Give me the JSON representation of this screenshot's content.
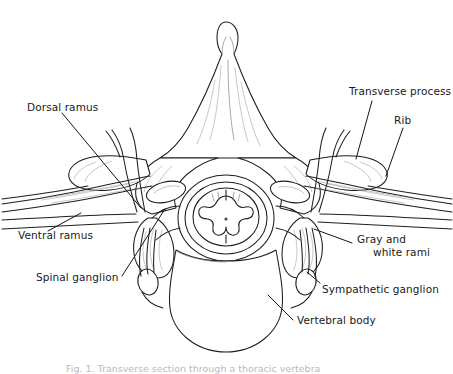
{
  "figure": {
    "background_color": "#ffffff",
    "line_color": "#1d1d1d",
    "label_color": "#1a1a1a",
    "caption_partial": "Fig. 1. Transverse section through a thoracic vertebra"
  },
  "labels": {
    "dorsal_ramus": "Dorsal ramus",
    "ventral_ramus": "Ventral ramus",
    "spinal_ganglion": "Spinal ganglion",
    "transverse_process": "Transverse process",
    "rib": "Rib",
    "gray_rami_line1": "Gray and",
    "gray_rami_line2": "white rami",
    "sympathetic_ganglion": "Sympathetic ganglion",
    "vertebral_body": "Vertebral body"
  },
  "structures": [
    {
      "name": "spinous-process",
      "side": "center"
    },
    {
      "name": "spinal-cord",
      "side": "center"
    },
    {
      "name": "vertebral-body",
      "side": "center"
    },
    {
      "name": "transverse-process",
      "side": "both"
    },
    {
      "name": "rib",
      "side": "both"
    },
    {
      "name": "dorsal-ramus",
      "side": "both"
    },
    {
      "name": "ventral-ramus",
      "side": "both"
    },
    {
      "name": "spinal-ganglion",
      "side": "both"
    },
    {
      "name": "sympathetic-ganglion",
      "side": "both"
    },
    {
      "name": "gray-and-white-rami",
      "side": "both"
    }
  ]
}
